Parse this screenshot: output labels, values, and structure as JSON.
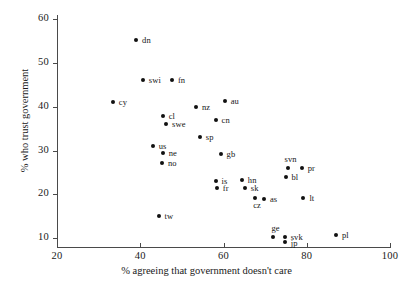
{
  "chart_data": {
    "type": "scatter",
    "title": "",
    "xlabel": "% agreeing that government doesn't care",
    "ylabel": "% who trust government",
    "xlim": [
      20,
      100
    ],
    "ylim": [
      8,
      61
    ],
    "xticks": [
      20,
      40,
      60,
      80,
      100
    ],
    "yticks": [
      10,
      20,
      30,
      40,
      50,
      60
    ],
    "grid": false,
    "legend": "none",
    "marker_color": "#111111",
    "axis_color": "#4a4a4a",
    "points": [
      {
        "label": "dn",
        "x": 39.0,
        "y": 55.2,
        "lx": 6,
        "ly": -4
      },
      {
        "label": "swi",
        "x": 40.6,
        "y": 46.1,
        "lx": 6,
        "ly": -4
      },
      {
        "label": "fn",
        "x": 47.6,
        "y": 46.1,
        "lx": 6,
        "ly": -4
      },
      {
        "label": "cy",
        "x": 33.4,
        "y": 41.1,
        "lx": 6,
        "ly": -4
      },
      {
        "label": "au",
        "x": 60.3,
        "y": 41.4,
        "lx": 6,
        "ly": -4
      },
      {
        "label": "nz",
        "x": 53.4,
        "y": 39.9,
        "lx": 6,
        "ly": -4
      },
      {
        "label": "cl",
        "x": 45.4,
        "y": 38.0,
        "lx": 6,
        "ly": -4
      },
      {
        "label": "cn",
        "x": 58.1,
        "y": 37.1,
        "lx": 6,
        "ly": -4
      },
      {
        "label": "swe",
        "x": 46.2,
        "y": 36.2,
        "lx": 6,
        "ly": -4
      },
      {
        "label": "sp",
        "x": 54.3,
        "y": 33.2,
        "lx": 6,
        "ly": -4
      },
      {
        "label": "us",
        "x": 43.0,
        "y": 31.0,
        "lx": 6,
        "ly": -4
      },
      {
        "label": "ne",
        "x": 45.4,
        "y": 29.5,
        "lx": 6,
        "ly": -4
      },
      {
        "label": "gb",
        "x": 59.3,
        "y": 29.2,
        "lx": 6,
        "ly": -4
      },
      {
        "label": "no",
        "x": 45.2,
        "y": 27.3,
        "lx": 6,
        "ly": -4
      },
      {
        "label": "svn",
        "x": 75.4,
        "y": 26.1,
        "lx": -3,
        "ly": -13
      },
      {
        "label": "pr",
        "x": 78.8,
        "y": 26.1,
        "lx": 6,
        "ly": -4
      },
      {
        "label": "bl",
        "x": 74.9,
        "y": 24.1,
        "lx": 6,
        "ly": -4
      },
      {
        "label": "is",
        "x": 58.1,
        "y": 23.1,
        "lx": 6,
        "ly": -4
      },
      {
        "label": "hn",
        "x": 64.4,
        "y": 23.4,
        "lx": 6,
        "ly": -4
      },
      {
        "label": "fr",
        "x": 58.4,
        "y": 21.4,
        "lx": 6,
        "ly": -4
      },
      {
        "label": "sk",
        "x": 65.1,
        "y": 21.4,
        "lx": 6,
        "ly": -4
      },
      {
        "label": "cz",
        "x": 67.6,
        "y": 19.2,
        "lx": -2,
        "ly": 3
      },
      {
        "label": "as",
        "x": 69.7,
        "y": 19.0,
        "lx": 6,
        "ly": -4
      },
      {
        "label": "lt",
        "x": 79.2,
        "y": 19.1,
        "lx": 6,
        "ly": -4
      },
      {
        "label": "tw",
        "x": 44.4,
        "y": 15.0,
        "lx": 6,
        "ly": -4
      },
      {
        "label": "ge",
        "x": 72.0,
        "y": 10.3,
        "lx": -2,
        "ly": -13
      },
      {
        "label": "svk",
        "x": 74.7,
        "y": 10.3,
        "lx": 6,
        "ly": -4
      },
      {
        "label": "jp",
        "x": 74.7,
        "y": 9.1,
        "lx": 6,
        "ly": -3
      },
      {
        "label": "pl",
        "x": 87.0,
        "y": 10.8,
        "lx": 6,
        "ly": -4
      }
    ]
  }
}
